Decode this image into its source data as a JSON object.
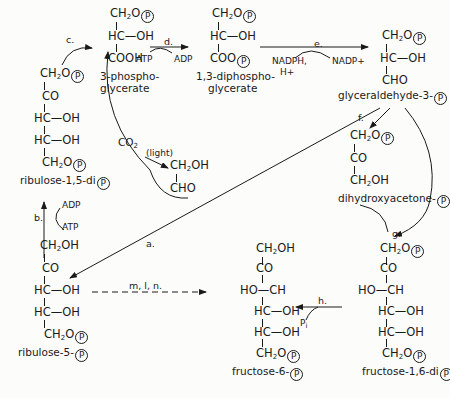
{
  "molecules": {
    "pga": {
      "rows": [
        "CH2O(P)",
        "HC—OH",
        "COOH"
      ],
      "name_line1": "3-phospho-",
      "name_line2": "glycerate"
    },
    "dpga": {
      "rows": [
        "CH2O(P)",
        "HC—OH",
        "COO(P)"
      ],
      "name_line1": "1,3-diphospho-",
      "name_line2": "glycerate"
    },
    "gap": {
      "rows": [
        "CH2O(P)",
        "HC—OH",
        "CHO"
      ],
      "name": "glyceraldehyde-3-"
    },
    "rubp": {
      "rows": [
        "CH2O(P)",
        "CO",
        "HC—OH",
        "HC—OH",
        "CH2O(P)"
      ],
      "name": "ribulose-1,5-di"
    },
    "glycolaldehyde": {
      "rows": [
        "CH2OH",
        "CHO"
      ]
    },
    "dhap": {
      "rows": [
        "CH2O(P)",
        "CO",
        "CH2OH"
      ],
      "name": "dihydroxyacetone-"
    },
    "ru5p": {
      "rows": [
        "CH2OH",
        "CO",
        "HC—OH",
        "HC—OH",
        "CH2O(P)"
      ],
      "name": "ribulose-5-"
    },
    "f6p": {
      "rows": [
        "CH2OH",
        "CO",
        "HO—CH",
        "HC—OH",
        "HC—OH",
        "CH2O(P)"
      ],
      "name": "fructose-6-"
    },
    "fbp": {
      "rows": [
        "CH2O(P)",
        "CO",
        "HO—CH",
        "HC—OH",
        "HC—OH",
        "CH2O(P)"
      ],
      "name": "fructose-1,6-di"
    }
  },
  "cofactors": {
    "atp_d": "ATP",
    "adp_d": "ADP",
    "nadph": "NADPH,",
    "hplus": "H+",
    "nadp": "NADP+",
    "adp_b": "ADP",
    "atp_b": "ATP",
    "co2": "CO2",
    "light": "(light)",
    "pi": "Pi"
  },
  "enzymes": {
    "a": "a.",
    "b": "b.",
    "c": "c.",
    "d": "d.",
    "e": "e.",
    "f": "f.",
    "g": "g.",
    "h": "h.",
    "mln": "m, l, n."
  },
  "phosphate_symbol": "P",
  "colors": {
    "ink": "#1a1a1a",
    "paper": "#fcfcfa"
  }
}
